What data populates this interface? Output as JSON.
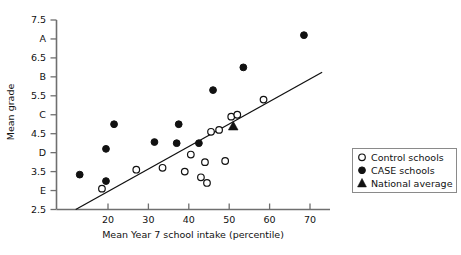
{
  "chart_data": {
    "type": "scatter",
    "title": "",
    "xlabel": "Mean Year 7 school intake (percentile)",
    "ylabel": "Mean grade",
    "xlim": [
      8,
      76
    ],
    "ylim": [
      2.5,
      7.5
    ],
    "grid": false,
    "legend_position": "right-outside",
    "xticks": [
      20,
      30,
      40,
      50,
      60,
      70
    ],
    "xtick_labels": [
      "20",
      "30",
      "40",
      "50",
      "60",
      "70"
    ],
    "yticks": [
      2.5,
      3,
      3.5,
      4,
      4.5,
      5,
      5.5,
      6,
      6.5,
      7,
      7.5
    ],
    "ytick_labels": [
      "2.5",
      "E",
      "3.5",
      "D",
      "4.5",
      "C",
      "5.5",
      "B",
      "6.5",
      "A",
      "7.5"
    ],
    "series": [
      {
        "name": "Control schools",
        "marker": "open-circle",
        "color": "#ffffff",
        "edge_color": "#111111",
        "points": [
          {
            "x": 18.5,
            "y": 3.05
          },
          {
            "x": 27.0,
            "y": 3.55
          },
          {
            "x": 33.5,
            "y": 3.6
          },
          {
            "x": 39.0,
            "y": 3.5
          },
          {
            "x": 40.5,
            "y": 3.95
          },
          {
            "x": 43.0,
            "y": 3.35
          },
          {
            "x": 44.5,
            "y": 3.2
          },
          {
            "x": 44.0,
            "y": 3.75
          },
          {
            "x": 45.5,
            "y": 4.55
          },
          {
            "x": 47.5,
            "y": 4.6
          },
          {
            "x": 49.0,
            "y": 3.78
          },
          {
            "x": 50.5,
            "y": 4.95
          },
          {
            "x": 52.0,
            "y": 5.0
          },
          {
            "x": 58.5,
            "y": 5.4
          }
        ]
      },
      {
        "name": "CASE schools",
        "marker": "filled-circle",
        "color": "#111111",
        "edge_color": "#111111",
        "points": [
          {
            "x": 13.0,
            "y": 3.42
          },
          {
            "x": 19.5,
            "y": 4.1
          },
          {
            "x": 19.5,
            "y": 3.25
          },
          {
            "x": 21.5,
            "y": 4.75
          },
          {
            "x": 31.5,
            "y": 4.28
          },
          {
            "x": 37.5,
            "y": 4.75
          },
          {
            "x": 37.0,
            "y": 4.25
          },
          {
            "x": 42.5,
            "y": 4.25
          },
          {
            "x": 46.0,
            "y": 5.65
          },
          {
            "x": 53.5,
            "y": 6.25
          },
          {
            "x": 68.5,
            "y": 7.1
          }
        ]
      },
      {
        "name": "National average",
        "marker": "filled-triangle",
        "color": "#111111",
        "edge_color": "#111111",
        "points": [
          {
            "x": 51.0,
            "y": 4.7
          }
        ]
      }
    ],
    "fit_line": {
      "name": "regression line",
      "x_start": 12.0,
      "y_start": 2.5,
      "x_end": 73.0,
      "y_end": 6.12
    }
  },
  "legend": {
    "items": [
      {
        "label": "Control schools",
        "marker": "open-circle"
      },
      {
        "label": "CASE schools",
        "marker": "filled-circle"
      },
      {
        "label": "National average",
        "marker": "filled-triangle"
      }
    ]
  }
}
